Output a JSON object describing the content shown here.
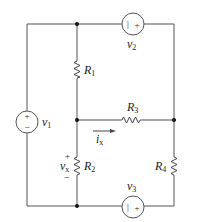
{
  "diagram": {
    "type": "circuit",
    "colors": {
      "wire": "#555555",
      "node": "#111111",
      "background": "#ffffff"
    },
    "sources": [
      {
        "id": "v1",
        "label": "v",
        "sub": "1",
        "polarity": [
          "+",
          "−"
        ]
      },
      {
        "id": "v2",
        "label": "v",
        "sub": "2",
        "polarity": [
          "|",
          "+"
        ]
      },
      {
        "id": "v3",
        "label": "v",
        "sub": "3",
        "polarity": [
          "|",
          "+"
        ]
      }
    ],
    "resistors": [
      {
        "id": "R1",
        "label": "R",
        "sub": "1"
      },
      {
        "id": "R2",
        "label": "R",
        "sub": "2"
      },
      {
        "id": "R3",
        "label": "R",
        "sub": "3"
      },
      {
        "id": "R4",
        "label": "R",
        "sub": "4"
      }
    ],
    "current": {
      "label": "i",
      "sub": "x"
    },
    "voltage": {
      "label": "v",
      "sub": "x",
      "plus": "+",
      "minus": "−"
    }
  }
}
